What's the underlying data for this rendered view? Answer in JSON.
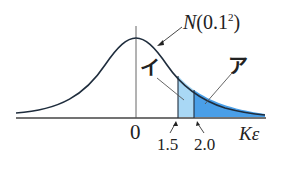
{
  "diagram": {
    "title_label": "N(0.1²)",
    "title_parts": {
      "N": "N",
      "args": "(0.1",
      "sup": "2",
      "close": ")"
    },
    "region_labels": {
      "i": "イ",
      "a": "ア"
    },
    "axis": {
      "origin_label": "0",
      "x_label": "Kε",
      "ticks": [
        "1.5",
        "2.0"
      ]
    },
    "colors": {
      "curve": "#1f2d3d",
      "axis": "#333333",
      "region_i_fill": "#a9d8f5",
      "region_a_fill": "#4a9fe8"
    }
  }
}
